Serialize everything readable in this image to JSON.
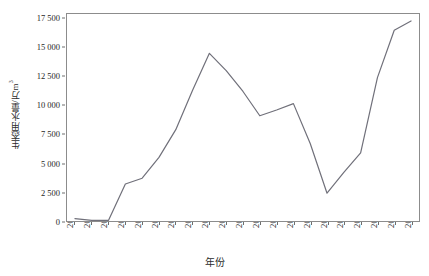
{
  "chart_data": {
    "type": "line",
    "title": "",
    "xlabel": "年份",
    "ylabel": "生态用水量/万m³",
    "ylabel_base": "生态用水量/万m",
    "ylabel_sup": "3",
    "categories": [
      "2000",
      "2001",
      "2002",
      "2003",
      "2004",
      "2005",
      "2006",
      "2007",
      "2008",
      "2009",
      "2010",
      "2011",
      "2012",
      "2013",
      "2014",
      "2015",
      "2016",
      "2017",
      "2018",
      "2019",
      "2020"
    ],
    "values": [
      200,
      60,
      60,
      3200,
      3700,
      5500,
      7900,
      11300,
      14500,
      13000,
      11200,
      9100,
      9600,
      10150,
      6700,
      2400,
      4200,
      5900,
      12400,
      16500,
      17300
    ],
    "series": [
      {
        "name": "生态用水量",
        "color": "#70707a",
        "values": [
          200,
          60,
          60,
          3200,
          3700,
          5500,
          7900,
          11300,
          14500,
          13000,
          11200,
          9100,
          9600,
          10150,
          6700,
          2400,
          4200,
          5900,
          12400,
          16500,
          17300
        ]
      }
    ],
    "ylim": [
      0,
      17900
    ],
    "yticks": [
      0,
      2500,
      5000,
      7500,
      10000,
      12500,
      15000,
      17500
    ],
    "ytick_labels": [
      "0",
      "2 500",
      "5 000",
      "7 500",
      "10 000",
      "12 500",
      "15 000",
      "17 500"
    ],
    "grid": false,
    "legend": "none",
    "line_width": 1.2,
    "markers": false,
    "axis_color": "#8c8c8c",
    "background": "#ffffff"
  }
}
